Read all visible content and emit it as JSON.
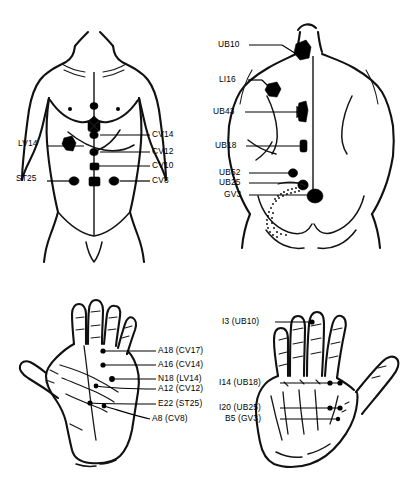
{
  "figure": {
    "background_color": "#ffffff",
    "ink_color": "#000000",
    "panels": [
      {
        "id": "front-torso",
        "name": "Anterior Torso",
        "position": "top-left"
      },
      {
        "id": "back-torso",
        "name": "Posterior Torso",
        "position": "top-right"
      },
      {
        "id": "left-hand",
        "name": "Left Hand Palmar View",
        "position": "bottom-left"
      },
      {
        "id": "right-hand",
        "name": "Right Hand Dorsal View",
        "position": "bottom-right"
      }
    ]
  },
  "front_torso": {
    "labels_left": [
      {
        "text": "LV14",
        "x": 18,
        "y": 143,
        "line_x1": 47,
        "line_x2": 84,
        "line_y": 146
      },
      {
        "text": "ST25",
        "x": 16,
        "y": 178,
        "line_x1": 47,
        "line_x2": 72,
        "line_y": 181
      }
    ],
    "labels_right": [
      {
        "text": "CV14",
        "x": 152,
        "y": 131,
        "line_x1": 102,
        "line_x2": 150,
        "line_y": 135
      },
      {
        "text": "CV12",
        "x": 152,
        "y": 148,
        "line_x1": 105,
        "line_x2": 150,
        "line_y": 152
      },
      {
        "text": "CV10",
        "x": 152,
        "y": 162,
        "line_x1": 105,
        "line_x2": 150,
        "line_y": 166
      },
      {
        "text": "CV8",
        "x": 152,
        "y": 177,
        "line_x1": 105,
        "line_x2": 150,
        "line_y": 181
      }
    ]
  },
  "back_torso": {
    "labels": [
      {
        "text": "UB10",
        "x": 218,
        "y": 41,
        "line_x1": 249,
        "line_x2": 296,
        "line_y": 45,
        "slope_y2": 58
      },
      {
        "text": "LI16",
        "x": 219,
        "y": 76,
        "line_x1": 248,
        "line_x2": 272,
        "line_y": 80,
        "slope_y2": 88
      },
      {
        "text": "UB43",
        "x": 213,
        "y": 108,
        "line_x1": 245,
        "line_x2": 300,
        "line_y": 112
      },
      {
        "text": "UB18",
        "x": 215,
        "y": 142,
        "line_x1": 246,
        "line_x2": 305,
        "line_y": 146
      },
      {
        "text": "UB52",
        "x": 219,
        "y": 169,
        "line_x1": 249,
        "line_x2": 300,
        "line_y": 173
      },
      {
        "text": "UB25",
        "x": 219,
        "y": 179,
        "line_x1": 249,
        "line_x2": 307,
        "line_y": 183
      },
      {
        "text": "GV3",
        "x": 224,
        "y": 191,
        "line_x1": 249,
        "line_x2": 315,
        "line_y": 195
      }
    ]
  },
  "left_hand": {
    "labels": [
      {
        "text": "A18 (CV17)",
        "x": 158,
        "y": 347,
        "line_x1": 112,
        "line_x2": 156,
        "line_y": 351
      },
      {
        "text": "A16 (CV14)",
        "x": 158,
        "y": 361,
        "line_x1": 112,
        "line_x2": 156,
        "line_y": 365
      },
      {
        "text": "N18 (LV14)",
        "x": 158,
        "y": 375,
        "line_x1": 126,
        "line_x2": 156,
        "line_y": 379
      },
      {
        "text": "A12 (CV12)",
        "x": 158,
        "y": 388,
        "line_x1": 112,
        "line_x2": 156,
        "line_y": 389
      },
      {
        "text": "E22 (ST25)",
        "x": 158,
        "y": 403,
        "line_x1": 110,
        "line_x2": 156,
        "line_y": 404
      },
      {
        "text": "A8 (CV8)",
        "x": 152,
        "y": 420,
        "line_x1": 116,
        "line_x2": 150,
        "line_y": 419
      }
    ]
  },
  "right_hand": {
    "labels": [
      {
        "text": "I3 (UB10)",
        "x": 222,
        "y": 318,
        "line_x1": 275,
        "line_x2": 312,
        "line_y": 322
      },
      {
        "text": "I14 (UB18)",
        "x": 219,
        "y": 379,
        "line_x1": 280,
        "line_x2": 340,
        "line_y": 383
      },
      {
        "text": "I20 (UB25)",
        "x": 219,
        "y": 404,
        "line_x1": 280,
        "line_x2": 340,
        "line_y": 408
      },
      {
        "text": "B5 (GV3)",
        "x": 225,
        "y": 415,
        "line_x1": 280,
        "line_x2": 340,
        "line_y": 419
      }
    ]
  },
  "point_legend": {
    "front_points": [
      "CV17",
      "CV14",
      "CV12",
      "CV10",
      "CV8",
      "LV14",
      "ST25"
    ],
    "back_points": [
      "UB10",
      "LI16",
      "UB43",
      "UB18",
      "UB52",
      "UB25",
      "GV3"
    ],
    "left_hand_points": [
      "A18",
      "A16",
      "N18",
      "A12",
      "E22",
      "A8"
    ],
    "right_hand_points": [
      "I3",
      "I14",
      "I20",
      "B5"
    ]
  }
}
